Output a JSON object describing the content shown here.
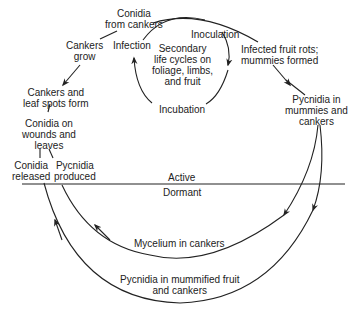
{
  "diagram": {
    "type": "disease-cycle",
    "labels": {
      "conidia_from_cankers": [
        "Conidia",
        "from cankers"
      ],
      "cankers_grow": [
        "Cankers",
        "grow"
      ],
      "infection": [
        "Infection"
      ],
      "inoculation": [
        "Inoculation"
      ],
      "secondary": [
        "Secondary",
        "life cycles on",
        "foliage, limbs,",
        "and fruit"
      ],
      "incubation": [
        "Incubation"
      ],
      "infected_fruit": [
        "Infected fruit rots;",
        "mummies formed"
      ],
      "pycnidia_mummies": [
        "Pycnidia in",
        "mummies and",
        "cankers"
      ],
      "cankers_leaf_spots": [
        "Cankers and",
        "leaf spots form"
      ],
      "conidia_wounds": [
        "Conidia on",
        "wounds and",
        "leaves"
      ],
      "conidia_released": [
        "Conidia",
        "released"
      ],
      "pycnidia_produced": [
        "Pycnidia",
        "produced"
      ],
      "active": [
        "Active"
      ],
      "dormant": [
        "Dormant"
      ],
      "mycelium": [
        "Mycelium in cankers"
      ],
      "pycnidia_mummified": [
        "Pycnidia in mummified fruit",
        "and cankers"
      ]
    },
    "line_color": "#222222"
  }
}
